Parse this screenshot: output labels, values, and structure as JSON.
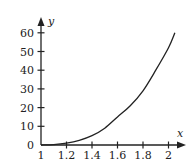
{
  "chart_data": {
    "type": "line",
    "title": "",
    "xlabel": "x",
    "ylabel": "y",
    "xlim": [
      1,
      2.1
    ],
    "ylim": [
      0,
      65
    ],
    "grid": false,
    "legend": null,
    "x_ticks": [
      "1",
      "1.2",
      "1.4",
      "1.6",
      "1.8",
      "2"
    ],
    "y_ticks": [
      "0",
      "10",
      "20",
      "30",
      "40",
      "50",
      "60"
    ],
    "series": [
      {
        "name": "curve",
        "x": [
          1.0,
          1.1,
          1.2,
          1.3,
          1.4,
          1.5,
          1.6,
          1.7,
          1.8,
          1.9,
          2.0,
          2.05
        ],
        "y": [
          0,
          0.2,
          1,
          2.5,
          5,
          9,
          15,
          21,
          29,
          40,
          52,
          60
        ]
      }
    ]
  },
  "colors": {
    "axis": "#222222",
    "curve": "#222222",
    "background": "#ffffff"
  }
}
